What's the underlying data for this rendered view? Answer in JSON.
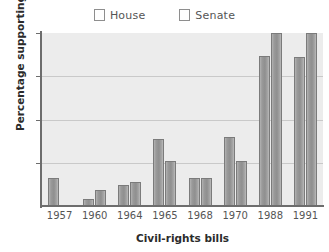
{
  "chart_data": {
    "type": "bar",
    "title": "",
    "xlabel": "Civil-rights bills",
    "ylabel": "Percentage supporting bill",
    "categories": [
      "1957",
      "1960",
      "1964",
      "1965",
      "1968",
      "1970",
      "1988",
      "1991"
    ],
    "series": [
      {
        "name": "House",
        "color": "#9a9a9a",
        "values": [
          16,
          4,
          12,
          39,
          16,
          40,
          87,
          86
        ]
      },
      {
        "name": "Senate",
        "color": "#9a9a9a",
        "values": [
          null,
          9,
          14,
          26,
          16,
          26,
          100,
          100
        ]
      }
    ],
    "ylim": [
      0,
      100
    ],
    "yticks": [
      25,
      50,
      75,
      100
    ],
    "ytick_labels": [
      "25",
      "50",
      "75",
      "100"
    ],
    "grid": true,
    "legend_position": "top-center",
    "plot_background": "#ececec",
    "axis_color": "#6d6d6d",
    "gridline_color": "#c9c9c9"
  },
  "legend": {
    "entries": [
      {
        "label": "House"
      },
      {
        "label": "Senate"
      }
    ]
  }
}
